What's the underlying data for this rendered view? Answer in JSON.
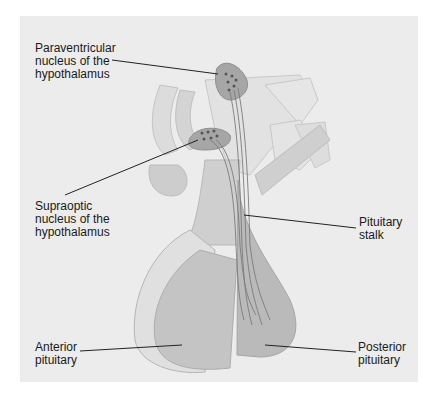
{
  "figure": {
    "labels": {
      "paraventricular": "Paraventricular\nnucleus of the\nhypothalamus",
      "supraoptic": "Supraoptic\nnucleus of the\nhypothalamus",
      "stalk": "Pituitary\nstalk",
      "anterior": "Anterior\npituitary",
      "posterior": "Posterior\npituitary"
    },
    "colors": {
      "background": "#ececec",
      "tissue_light": "#d9d9d9",
      "tissue_mid": "#bdbdbd",
      "tissue_dark": "#a8a8a8",
      "nucleus": "#9a9a9a",
      "leader": "#222222"
    }
  }
}
